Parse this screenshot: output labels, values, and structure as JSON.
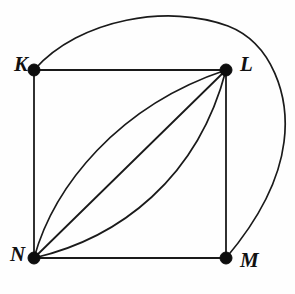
{
  "figure": {
    "name": "multigraph-klmn",
    "background_color": "#fefefe",
    "stroke_color": "#1a1a1a",
    "vertex_color": "#0d0d0d",
    "width": 295,
    "height": 294
  },
  "vertices": [
    {
      "id": "K",
      "label": "K",
      "x": 34,
      "y": 70,
      "radius": 6,
      "label_x": 14,
      "label_y": 66
    },
    {
      "id": "L",
      "label": "L",
      "x": 226,
      "y": 70,
      "radius": 6,
      "label_x": 240,
      "label_y": 66
    },
    {
      "id": "M",
      "label": "M",
      "x": 226,
      "y": 258,
      "radius": 6,
      "label_x": 240,
      "label_y": 262
    },
    {
      "id": "N",
      "label": "N",
      "x": 34,
      "y": 258,
      "radius": 6,
      "label_x": 10,
      "label_y": 256
    }
  ],
  "edges": [
    {
      "id": "KL",
      "from": "K",
      "to": "L",
      "kind": "straight",
      "path": "M 34 70 L 226 70"
    },
    {
      "id": "KN",
      "from": "K",
      "to": "N",
      "kind": "straight",
      "path": "M 34 70 L 34 258"
    },
    {
      "id": "LM",
      "from": "L",
      "to": "M",
      "kind": "straight",
      "path": "M 226 70 L 226 258"
    },
    {
      "id": "NM",
      "from": "N",
      "to": "M",
      "kind": "straight",
      "path": "M 34 258 L 226 258"
    },
    {
      "id": "NL-straight",
      "from": "N",
      "to": "L",
      "kind": "straight",
      "path": "M 34 258 L 226 70"
    },
    {
      "id": "NL-curve-upper",
      "from": "N",
      "to": "L",
      "kind": "curve",
      "path": "M 34 258 C 54 186 118 106 226 70"
    },
    {
      "id": "NL-curve-lower",
      "from": "N",
      "to": "L",
      "kind": "curve",
      "path": "M 34 258 C 120 238 198 178 226 70"
    },
    {
      "id": "KM-outer-loop",
      "from": "K",
      "to": "M",
      "kind": "curve",
      "path": "M 34 70 C 80 18 170 4 228 26 C 272 43 290 96 284 142 C 278 190 248 232 226 258"
    }
  ],
  "edge_counts": {
    "K-L": 1,
    "K-N": 1,
    "L-M": 1,
    "N-M": 1,
    "N-L": 3,
    "K-M": 1
  }
}
